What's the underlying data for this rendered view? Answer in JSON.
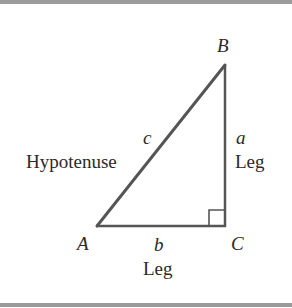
{
  "diagram": {
    "type": "right-triangle",
    "vertices": {
      "A": {
        "label": "A",
        "x": 97,
        "y": 226
      },
      "B": {
        "label": "B",
        "x": 225,
        "y": 65
      },
      "C": {
        "label": "C",
        "x": 225,
        "y": 226
      }
    },
    "sides": {
      "c": {
        "letter": "c",
        "name": "Hypotenuse",
        "from": "A",
        "to": "B"
      },
      "a": {
        "letter": "a",
        "name": "Leg",
        "from": "B",
        "to": "C"
      },
      "b": {
        "letter": "b",
        "name": "Leg",
        "from": "A",
        "to": "C"
      }
    },
    "right_angle_at": "C",
    "colors": {
      "line": "#555555",
      "text": "#2a2a2a",
      "border": "#9b9b9b",
      "background": "#ffffff"
    }
  }
}
